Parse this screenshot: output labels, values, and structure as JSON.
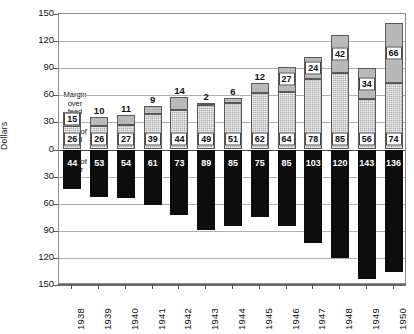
{
  "chart_data": {
    "type": "bar",
    "title": "",
    "subtitle": "",
    "xlabel": "",
    "ylabel": "Dollars",
    "categories": [
      "1938",
      "1939",
      "1940",
      "1941",
      "1942",
      "1943",
      "1944",
      "1945",
      "1946",
      "1947",
      "1948",
      "1949",
      "1950"
    ],
    "series": [
      {
        "name": "Margin over feed",
        "values": [
          15,
          10,
          11,
          9,
          14,
          2,
          6,
          12,
          27,
          24,
          42,
          34,
          66
        ],
        "direction": "up",
        "color": "#b9b9b9"
      },
      {
        "name": "Cost of feed",
        "values": [
          26,
          26,
          27,
          39,
          44,
          49,
          51,
          62,
          64,
          78,
          85,
          56,
          74
        ],
        "direction": "up",
        "color": "#aeaeae"
      },
      {
        "name": "Cost of steer",
        "values": [
          44,
          53,
          54,
          61,
          73,
          89,
          85,
          75,
          85,
          103,
          120,
          143,
          136
        ],
        "direction": "down",
        "color": "#0d0d0d"
      }
    ],
    "y_ticks_up": [
      0,
      30,
      60,
      90,
      120,
      150
    ],
    "y_ticks_down": [
      0,
      30,
      60,
      90,
      120,
      150
    ],
    "ytick_labels": [
      "150",
      "120",
      "90",
      "60",
      "30",
      "0",
      "30",
      "60",
      "90",
      "120",
      "150"
    ],
    "ylim_up": [
      0,
      150
    ],
    "ylim_down": [
      0,
      150
    ],
    "grid": true,
    "legend_position": "inline-annotations"
  },
  "annotations": {
    "margin_over_feed": "Margin\nover\nfeed",
    "margin_line1": "Margin",
    "margin_line2": "over",
    "margin_line3": "feed",
    "cost_of_feed_line1": "Cost of",
    "cost_of_feed_line2": "feed",
    "cost_of_steer_line1": "Cost of",
    "cost_of_steer_line2": "steer"
  },
  "axis": {
    "y_title": "Dollars"
  }
}
